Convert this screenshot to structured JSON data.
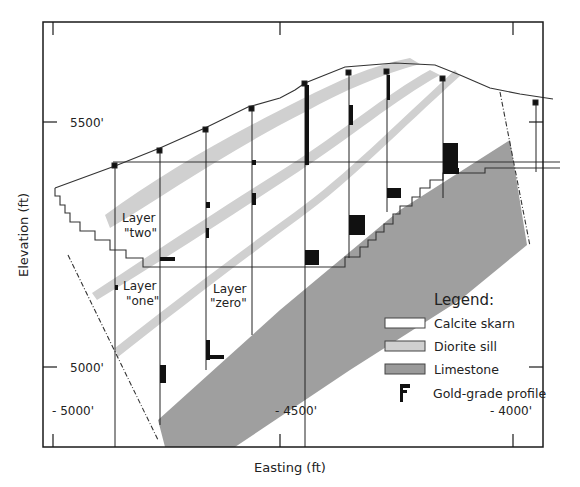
{
  "figure": {
    "type": "geologic-cross-section",
    "x_axis_label": "Easting (ft)",
    "y_axis_label": "Elevation (ft)",
    "x_ticks": [
      {
        "label": "- 5000'",
        "x": 53
      },
      {
        "label": "- 4500'",
        "x": 280
      },
      {
        "label": "- 4000'",
        "x": 513
      }
    ],
    "y_ticks": [
      {
        "label": "5500'",
        "y": 122
      },
      {
        "label": "5000'",
        "y": 367
      }
    ],
    "layer_labels": [
      {
        "line1": "Layer",
        "line2": "\"two\""
      },
      {
        "line1": "Layer",
        "line2": "\"one\""
      },
      {
        "line1": "Layer",
        "line2": "\"zero\""
      }
    ],
    "legend": {
      "title": "Legend:",
      "items": [
        {
          "label": "Calcite skarn",
          "swatch": "#ffffff"
        },
        {
          "label": "Diorite sill",
          "swatch": "#d0d0d0"
        },
        {
          "label": "Limestone",
          "swatch": "#9a9a9a"
        },
        {
          "label": "Gold-grade profile",
          "swatch": "#111111"
        }
      ]
    },
    "colors": {
      "frame": "#1a1a1a",
      "diorite": "#d0d0d0",
      "limestone": "#9a9a9a",
      "gold_profile": "#111111"
    }
  }
}
